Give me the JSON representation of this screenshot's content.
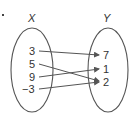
{
  "diagram": {
    "type": "mapping",
    "domain_set": {
      "name": "X",
      "elements": [
        "3",
        "5",
        "9",
        "−3"
      ]
    },
    "range_set": {
      "name": "Y",
      "elements": [
        "7",
        "1",
        "2"
      ]
    },
    "mappings": [
      {
        "from": "3",
        "to": "7"
      },
      {
        "from": "5",
        "to": "2"
      },
      {
        "from": "9",
        "to": "1"
      },
      {
        "from": "−3",
        "to": "2"
      }
    ],
    "colors": {
      "stroke": "#555555",
      "text": "#333333"
    }
  }
}
